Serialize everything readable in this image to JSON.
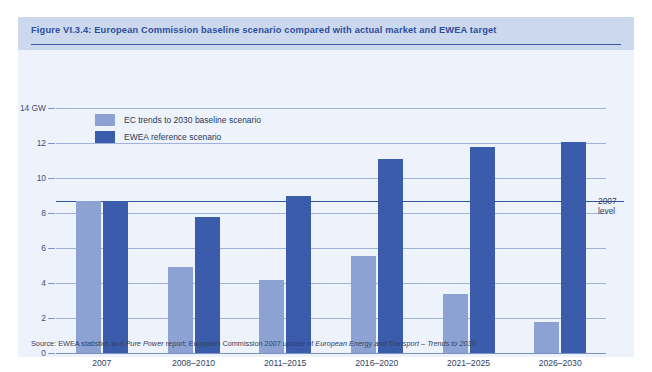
{
  "figure": {
    "title": "Figure VI.3.4: European Commission baseline scenario compared with actual market and EWEA target",
    "source_prefix": "Source: EWEA statistics and ",
    "source_italic_1": "Pure Power",
    "source_mid": " report; European Commission 2007 update of ",
    "source_italic_2": "European Energy and Transport – Trends to 2030",
    "level_label_line1": "2007",
    "level_label_line2": "level",
    "colors": {
      "background": "#eef2fa",
      "header_band": "#ccd8ee",
      "title_text": "#2e4f9e",
      "ec_bar": "#8ba2d2",
      "ewea_bar": "#3a5cab",
      "gridline": "#9fb3da",
      "level_line": "#32539d"
    }
  },
  "chart_data": {
    "type": "bar",
    "title": "Figure VI.3.4: European Commission baseline scenario compared with actual market and EWEA target",
    "subtitle": "",
    "xlabel": "",
    "ylabel": "GW",
    "ylim": [
      0,
      14
    ],
    "yticks": [
      0,
      2,
      4,
      6,
      8,
      10,
      12,
      14
    ],
    "ytick_labels": [
      "0",
      "2",
      "4",
      "6",
      "8",
      "10",
      "12",
      "14 GW"
    ],
    "grid": true,
    "legend_position": "top-left",
    "categories": [
      "2007",
      "2008–2010",
      "2011–2015",
      "2016–2020",
      "2021–2025",
      "2026–2030"
    ],
    "series": [
      {
        "name": "EC trends to 2030 baseline scenario",
        "color": "#8ba2d2",
        "values": [
          8.7,
          4.9,
          4.2,
          5.55,
          3.35,
          1.75
        ]
      },
      {
        "name": "EWEA reference scenario",
        "color": "#3a5cab",
        "values": [
          8.7,
          7.8,
          9.0,
          11.1,
          11.75,
          12.05
        ]
      }
    ],
    "annotations": [
      {
        "name": "2007 level",
        "type": "hline",
        "value": 8.7,
        "label": "2007 level"
      }
    ]
  }
}
